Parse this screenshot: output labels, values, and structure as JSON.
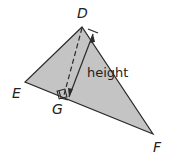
{
  "diagram": {
    "vertices": [
      {
        "id": "D",
        "label": "D",
        "x": 82,
        "y": 27
      },
      {
        "id": "E",
        "label": "E",
        "x": 25,
        "y": 82
      },
      {
        "id": "F",
        "label": "F",
        "x": 153,
        "y": 134
      }
    ],
    "foot": {
      "id": "G",
      "label": "G",
      "x": 64,
      "y": 96
    },
    "height_label": "height",
    "colors": {
      "fill": "#c4c4c4",
      "stroke": "#2a2a2a",
      "text": "#222222"
    }
  }
}
